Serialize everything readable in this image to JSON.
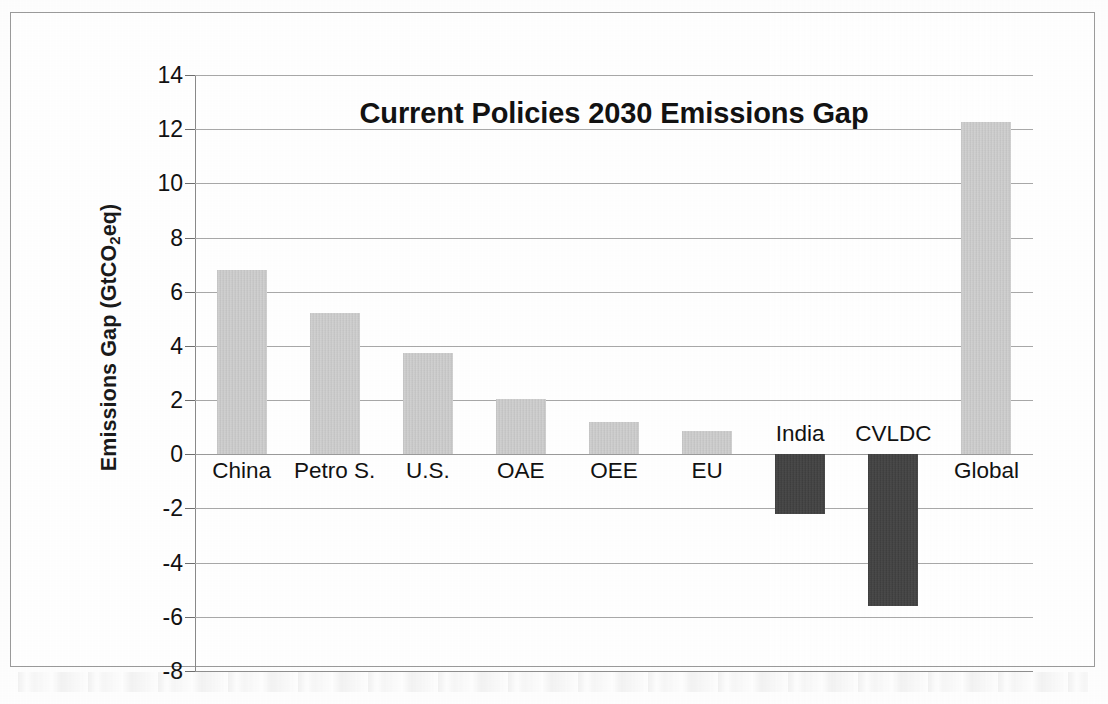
{
  "chart_data": {
    "type": "bar",
    "title": "Current Policies 2030 Emissions Gap",
    "xlabel": "",
    "ylabel": "Emissions Gap (GtCO2eq)",
    "ylabel_parts": {
      "prefix": "Emissions Gap (GtCO",
      "sub": "2",
      "suffix": "eq)"
    },
    "categories": [
      "China",
      "Petro S.",
      "U.S.",
      "OAE",
      "OEE",
      "EU",
      "India",
      "CVLDC",
      "Global"
    ],
    "values": [
      6.8,
      5.2,
      3.75,
      2.05,
      1.2,
      0.85,
      -2.2,
      -5.6,
      12.25
    ],
    "ylim": [
      -8,
      14
    ],
    "ytick_step": 2,
    "ytick_labels": [
      "14",
      "12",
      "10",
      "8",
      "6",
      "4",
      "2",
      "0",
      "-2",
      "-4",
      "-6",
      "-8"
    ],
    "ytick_values": [
      14,
      12,
      10,
      8,
      6,
      4,
      2,
      0,
      -2,
      -4,
      -6,
      -8
    ],
    "grid": true,
    "grid_axis": "y",
    "legend": "none",
    "bar_colors": {
      "positive": "#c9c9c9",
      "negative": "#414141"
    },
    "series": [
      {
        "name": "Emissions Gap",
        "points": [
          {
            "category": "China",
            "value": 6.8,
            "sign": "positive"
          },
          {
            "category": "Petro S.",
            "value": 5.2,
            "sign": "positive"
          },
          {
            "category": "U.S.",
            "value": 3.75,
            "sign": "positive"
          },
          {
            "category": "OAE",
            "value": 2.05,
            "sign": "positive"
          },
          {
            "category": "OEE",
            "value": 1.2,
            "sign": "positive"
          },
          {
            "category": "EU",
            "value": 0.85,
            "sign": "positive"
          },
          {
            "category": "India",
            "value": -2.2,
            "sign": "negative"
          },
          {
            "category": "CVLDC",
            "value": -5.6,
            "sign": "negative"
          },
          {
            "category": "Global",
            "value": 12.25,
            "sign": "positive"
          }
        ]
      }
    ]
  }
}
